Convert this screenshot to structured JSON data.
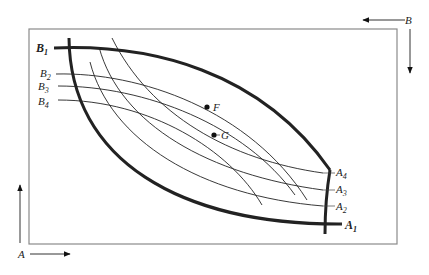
{
  "diagram": {
    "type": "edgeworth-box",
    "colors": {
      "line": "#222222",
      "frame": "#888888",
      "background": "#ffffff"
    },
    "origins": {
      "a": {
        "label": "A",
        "position": "bottom-left"
      },
      "b": {
        "label": "B",
        "position": "top-right"
      }
    },
    "curves_a": [
      {
        "label": "A",
        "sub": "1",
        "thick": true
      },
      {
        "label": "A",
        "sub": "2",
        "thick": false
      },
      {
        "label": "A",
        "sub": "3",
        "thick": false
      },
      {
        "label": "A",
        "sub": "4",
        "thick": false
      }
    ],
    "curves_b": [
      {
        "label": "B",
        "sub": "1",
        "thick": true
      },
      {
        "label": "B",
        "sub": "2",
        "thick": false
      },
      {
        "label": "B",
        "sub": "3",
        "thick": false
      },
      {
        "label": "B",
        "sub": "4",
        "thick": false
      }
    ],
    "points": [
      {
        "label": "F"
      },
      {
        "label": "G"
      }
    ]
  }
}
